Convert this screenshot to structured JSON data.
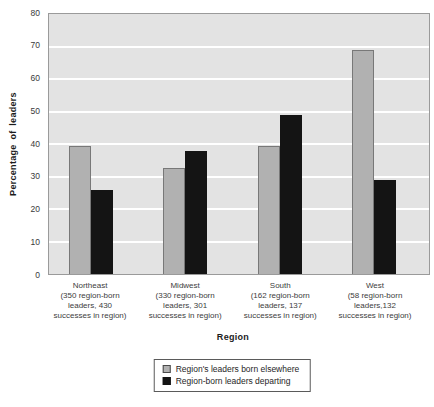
{
  "chart_data": {
    "type": "bar",
    "title": "",
    "xlabel": "Region",
    "ylabel": "Percentage of leaders",
    "ylim": [
      0,
      80
    ],
    "yticks": [
      0,
      10,
      20,
      30,
      40,
      50,
      60,
      70,
      80
    ],
    "grid": "horizontal-white-lines",
    "legend_position": "bottom",
    "plot_background": "#e3e3e3",
    "categories": [
      {
        "label": "Northeast",
        "detail_lines": [
          "(350 region-born",
          "leaders, 430",
          "successes in region)"
        ]
      },
      {
        "label": "Midwest",
        "detail_lines": [
          "(330 region-born",
          "leaders, 301",
          "successes in region)"
        ]
      },
      {
        "label": "South",
        "detail_lines": [
          "(162 region-born",
          "leaders, 137",
          "successes in region)"
        ]
      },
      {
        "label": "West",
        "detail_lines": [
          "(58 region-born",
          "leaders,132",
          "successes in region)"
        ]
      }
    ],
    "series": [
      {
        "name": "Region's leaders born elsewhere",
        "color": "#b1b1b1",
        "border_color": "#787878",
        "values": [
          39.5,
          32.5,
          39.5,
          69
        ]
      },
      {
        "name": "Region-born leaders departing",
        "color": "#141414",
        "border_color": "#141414",
        "values": [
          26,
          38,
          49,
          29
        ]
      }
    ]
  }
}
